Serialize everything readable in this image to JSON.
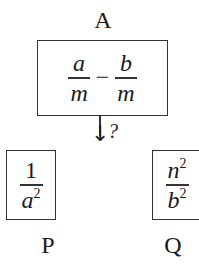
{
  "diagram": {
    "top_label": "A",
    "top_box": {
      "expression": "a/m − b/m",
      "term1": {
        "numerator": "a",
        "denominator": "m"
      },
      "operator": "−",
      "term2": {
        "numerator": "b",
        "denominator": "m"
      }
    },
    "arrow": {
      "symbol": "↓",
      "annotation": "?"
    },
    "left_box": {
      "expression": "1/a²",
      "numerator": "1",
      "denominator_base": "a",
      "denominator_exp": "2",
      "label": "P"
    },
    "right_box": {
      "expression": "n²/b²",
      "numerator_base": "n",
      "numerator_exp": "2",
      "denominator_base": "b",
      "denominator_exp": "2",
      "label": "Q"
    }
  }
}
